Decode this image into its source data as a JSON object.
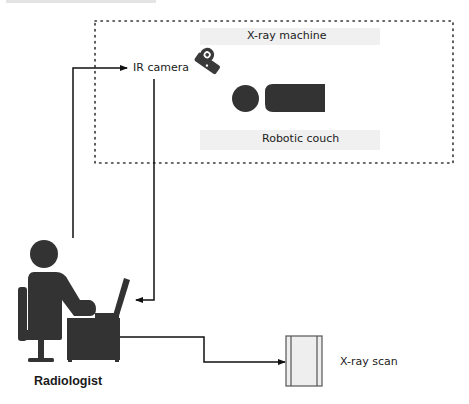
{
  "diagram": {
    "type": "workflow",
    "colors": {
      "icon_fill": "#333333",
      "line": "#111111",
      "dotted_border": "#333333",
      "band": "#ececec",
      "scan_fill": "#eeeeee"
    },
    "room": {
      "border_style": "dotted",
      "labels": {
        "xray_machine": "X-ray machine",
        "robotic_couch": "Robotic couch",
        "ir_camera": "IR camera"
      }
    },
    "actor": {
      "label": "Radiologist",
      "icon": "person-at-desk-with-laptop-icon"
    },
    "output": {
      "label": "X-ray scan",
      "icon": "document-scan-icon"
    },
    "connections": [
      {
        "from": "Radiologist",
        "to": "IR camera",
        "type": "arrow"
      },
      {
        "from": "IR camera",
        "to": "Radiologist",
        "type": "arrow"
      },
      {
        "from": "Radiologist",
        "to": "X-ray scan",
        "type": "arrow"
      }
    ],
    "icons": {
      "camera": "camera-icon",
      "patient": "patient-on-couch-icon"
    }
  }
}
